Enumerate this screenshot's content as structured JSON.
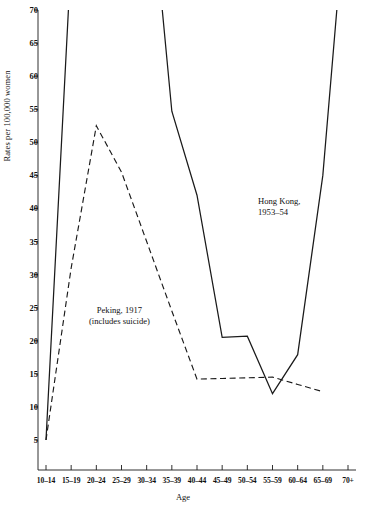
{
  "chart_data": {
    "type": "line",
    "title": "",
    "xlabel": "Age",
    "ylabel": "Rates per 100,000 women",
    "categories": [
      "10-14",
      "15-19",
      "20-24",
      "25-29",
      "30-34",
      "35-39",
      "40-44",
      "45-49",
      "50-54",
      "55-59",
      "60-64",
      "65-69",
      "70+"
    ],
    "ylim": [
      0,
      70
    ],
    "yticks": [
      5,
      10,
      15,
      20,
      25,
      30,
      35,
      40,
      45,
      50,
      55,
      60,
      65,
      70
    ],
    "grid": false,
    "legend_position": "inline-annotations",
    "series": [
      {
        "name": "Hong Kong, 1953-54",
        "style": "solid",
        "color": "#1a1a1a",
        "note": "values above 70 are off-scale and clipped at the top of the plot",
        "points": [
          {
            "x": "10-14",
            "y": 5.0
          },
          {
            "x": "15-19",
            "y": 78.0
          },
          {
            "x": "20-24",
            "y": 128.0
          },
          {
            "x": "25-29",
            "y": 120.0
          },
          {
            "x": "30-34",
            "y": 95.0
          },
          {
            "x": "35-39",
            "y": 54.7
          },
          {
            "x": "40-44",
            "y": 42.0
          },
          {
            "x": "45-49",
            "y": 20.5
          },
          {
            "x": "50-54",
            "y": 20.7
          },
          {
            "x": "55-59",
            "y": 12.0
          },
          {
            "x": "60-64",
            "y": 17.9
          },
          {
            "x": "65-69",
            "y": 45.0
          },
          {
            "x": "70+",
            "y": 90.0
          }
        ]
      },
      {
        "name": "Peking, 1917 (includes suicide)",
        "style": "dashed",
        "color": "#1a1a1a",
        "points": [
          {
            "x": "10-14",
            "y": 5.0
          },
          {
            "x": "15-19",
            "y": 31.0
          },
          {
            "x": "20-24",
            "y": 52.5
          },
          {
            "x": "25-29",
            "y": 45.5
          },
          {
            "x": "30-34",
            "y": 35.0
          },
          {
            "x": "35-39",
            "y": 24.5
          },
          {
            "x": "40-44",
            "y": 14.2
          },
          {
            "x": "45-49",
            "y": 14.3
          },
          {
            "x": "50-54",
            "y": 14.4
          },
          {
            "x": "55-59",
            "y": 14.5
          },
          {
            "x": "60-64",
            "y": 13.4
          },
          {
            "x": "65-69",
            "y": 12.3
          }
        ]
      }
    ],
    "annotations": [
      {
        "id": "peking",
        "line1": "Peking, 1917",
        "line2": "(includes suicide)"
      },
      {
        "id": "hongkong",
        "line1": "Hong Kong,",
        "line2": "1953–54"
      }
    ]
  },
  "axis": {
    "y_title": "Rates per 100,000 women",
    "x_title": "Age",
    "y_ticks": [
      "70",
      "65",
      "60",
      "55",
      "50",
      "45",
      "40",
      "35",
      "30",
      "25",
      "20",
      "15",
      "10",
      "5"
    ],
    "x_ticks": [
      "10–14",
      "15–19",
      "20–24",
      "25–29",
      "30–34",
      "35–39",
      "40–44",
      "45–49",
      "50–54",
      "55–59",
      "60–64",
      "65–69",
      "70+"
    ]
  },
  "annotations": {
    "peking_line1": "Peking, 1917",
    "peking_line2": "(includes suicide)",
    "hongkong_line1": "Hong Kong,",
    "hongkong_line2": "1953–54"
  },
  "colors": {
    "ink": "#1a1a1a",
    "background": "#ffffff"
  }
}
